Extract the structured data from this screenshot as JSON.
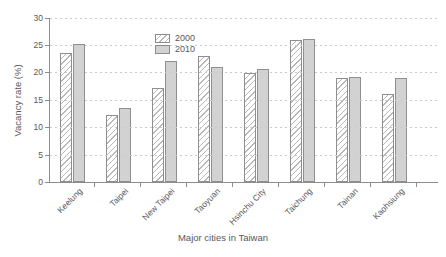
{
  "chart_data": {
    "type": "bar",
    "title": "",
    "categories": [
      "Keelung",
      "Taipei",
      "New Taipei",
      "Taoyuan",
      "Hsinchu City",
      "Taichung",
      "Tainan",
      "Kaohsiung"
    ],
    "series": [
      {
        "name": "2000",
        "style": "hatched",
        "values": [
          23.6,
          12.2,
          17.2,
          23.0,
          19.8,
          25.9,
          18.9,
          16.1
        ]
      },
      {
        "name": "2010",
        "style": "solid",
        "values": [
          25.1,
          13.5,
          22.0,
          21.0,
          20.6,
          26.1,
          19.2,
          19.0
        ]
      }
    ],
    "xlabel": "Major cities in Taiwan",
    "ylabel": "Vacancy rate (%)",
    "ylim": [
      0,
      30
    ],
    "yticks": [
      0,
      5,
      10,
      15,
      20,
      25,
      30
    ],
    "grid": true,
    "legend_position": "top-left-inset"
  },
  "colors": {
    "background": "#ffffff",
    "text": "#595959",
    "axis": "#8c8c8c",
    "grid": "#cbcbcb",
    "bar_2000_fill": "#ffffff",
    "bar_2000_hatch": "#b8b8b8",
    "bar_2010_fill": "#d2d2d2",
    "bar_border": "#8f8f8f"
  }
}
